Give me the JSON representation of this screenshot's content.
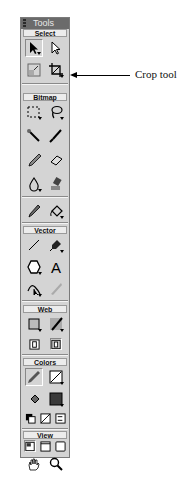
{
  "panel": {
    "title": "Tools",
    "sections": {
      "select": {
        "label": "Select",
        "tools": [
          "pointer-tool",
          "subselection-tool",
          "scale-tool",
          "crop-tool"
        ]
      },
      "bitmap": {
        "label": "Bitmap",
        "tools": [
          "marquee-tool",
          "lasso-tool",
          "magic-wand-tool",
          "brush-tool",
          "pencil-tool",
          "eraser-tool",
          "blur-tool",
          "rubber-stamp-tool",
          "eyedropper-tool",
          "paint-bucket-tool"
        ]
      },
      "vector": {
        "label": "Vector",
        "tools": [
          "line-tool",
          "pen-tool",
          "rectangle-tool",
          "text-tool",
          "freeform-tool",
          "knife-tool"
        ]
      },
      "web": {
        "label": "Web",
        "tools": [
          "hotspot-tool",
          "slice-tool",
          "hide-slices-button",
          "show-slices-button"
        ]
      },
      "colors": {
        "label": "Colors",
        "tools": [
          "stroke-color",
          "stroke-color-box",
          "fill-color",
          "fill-color-box",
          "default-colors",
          "no-stroke-fill",
          "swap-colors"
        ]
      },
      "view": {
        "label": "View",
        "tools": [
          "standard-screen-mode",
          "full-screen-menus-mode",
          "full-screen-mode",
          "hand-tool",
          "zoom-tool"
        ]
      }
    }
  },
  "annotation": {
    "label": "Crop tool"
  },
  "colors": {
    "panel_bg": "#d4d4d4",
    "titlebar_bg": "#6b6b6b",
    "fill_swatch": "#3a3a3a"
  }
}
